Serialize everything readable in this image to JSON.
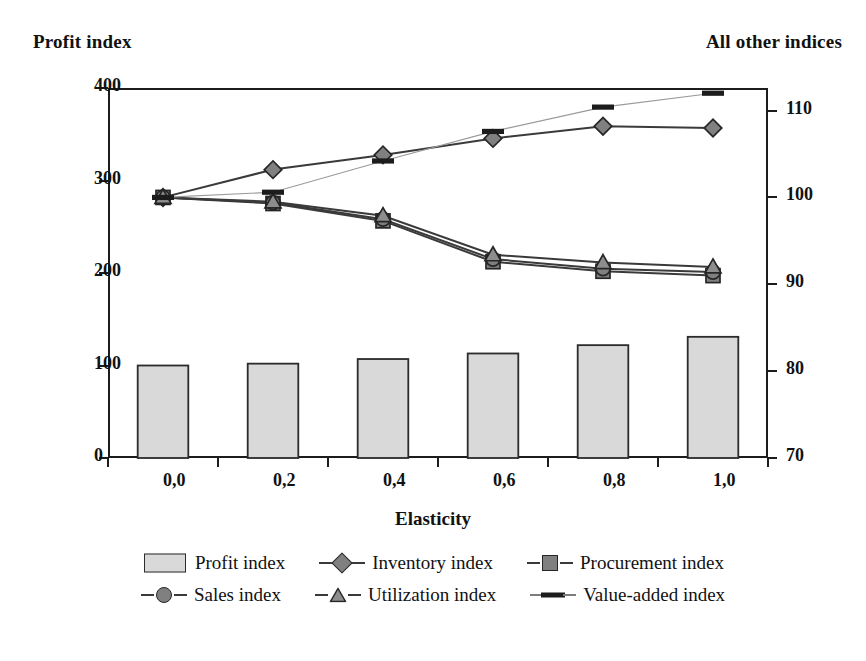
{
  "axis_titles": {
    "left": "Profit index",
    "right": "All other indices",
    "bottom": "Elasticity"
  },
  "left_ticks": [
    "0",
    "100",
    "200",
    "300",
    "400"
  ],
  "right_ticks": [
    "70",
    "80",
    "90",
    "100",
    "110"
  ],
  "x_ticks": [
    "0,0",
    "0,2",
    "0,4",
    "0,6",
    "0,8",
    "1,0"
  ],
  "legend": {
    "row1": [
      {
        "label": "Profit index",
        "key": "bar-swatch"
      },
      {
        "label": "Inventory index",
        "key": "diamond-marker"
      },
      {
        "label": "Procurement index",
        "key": "square-marker"
      }
    ],
    "row2": [
      {
        "label": "Sales index",
        "key": "circle-marker"
      },
      {
        "label": "Utilization index",
        "key": "triangle-marker"
      },
      {
        "label": "Value-added index",
        "key": "dash-marker"
      }
    ]
  },
  "colors": {
    "marker_fill": "#808080",
    "marker_stroke": "#262626",
    "bar_fill": "#d9d9d9",
    "bar_stroke": "#2b2b2b",
    "axis": "#1c1c1c",
    "line": "#3a3a3a",
    "thin_line": "#9a9a9a"
  },
  "chart_data": {
    "type": "bar",
    "title": "",
    "xlabel": "Elasticity",
    "ylabel": "Profit index",
    "y2label": "All other indices",
    "categories": [
      "0,0",
      "0,2",
      "0,4",
      "0,6",
      "0,8",
      "1,0"
    ],
    "x": [
      0.0,
      0.2,
      0.4,
      0.6,
      0.8,
      1.0
    ],
    "ylim": [
      0,
      400
    ],
    "y2lim": [
      70,
      112.6
    ],
    "yticks": [
      0,
      100,
      200,
      300,
      400
    ],
    "y2ticks": [
      70,
      80,
      90,
      100,
      110
    ],
    "grid": false,
    "legend_position": "bottom",
    "series": [
      {
        "name": "Profit index",
        "kind": "bar",
        "axis": "left",
        "marker": "bar-swatch",
        "values": [
          100,
          102,
          107,
          113,
          122,
          131
        ]
      },
      {
        "name": "Inventory index",
        "kind": "line",
        "axis": "right",
        "marker": "diamond-marker",
        "values": [
          100.0,
          103.2,
          104.9,
          106.8,
          108.2,
          108.0
        ]
      },
      {
        "name": "Procurement index",
        "kind": "line",
        "axis": "right",
        "marker": "square-marker",
        "values": [
          100.0,
          99.3,
          97.3,
          92.6,
          91.5,
          91.0
        ]
      },
      {
        "name": "Sales index",
        "kind": "line",
        "axis": "right",
        "marker": "circle-marker",
        "values": [
          100.0,
          99.4,
          97.5,
          92.9,
          91.8,
          91.4
        ]
      },
      {
        "name": "Utilization index",
        "kind": "line",
        "axis": "right",
        "marker": "triangle-marker",
        "values": [
          100.0,
          99.5,
          97.9,
          93.4,
          92.5,
          92.0
        ]
      },
      {
        "name": "Value-added index",
        "kind": "line",
        "axis": "right",
        "marker": "dash-marker",
        "values": [
          100.0,
          100.6,
          104.2,
          107.6,
          110.4,
          112.0
        ]
      }
    ]
  }
}
